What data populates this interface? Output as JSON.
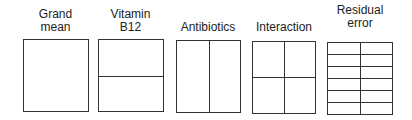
{
  "diagram": {
    "components": [
      {
        "label_line1": "Grand",
        "label_line2": "mean",
        "rows": 1,
        "cols": 1
      },
      {
        "label_line1": "Vitamin",
        "label_line2": "B12",
        "rows": 2,
        "cols": 1
      },
      {
        "label_line1": "",
        "label_line2": "Antibiotics",
        "rows": 1,
        "cols": 2
      },
      {
        "label_line1": "",
        "label_line2": "Interaction",
        "rows": 2,
        "cols": 2
      },
      {
        "label_line1": "Residual",
        "label_line2": "error",
        "rows": 6,
        "cols": 2
      }
    ]
  }
}
